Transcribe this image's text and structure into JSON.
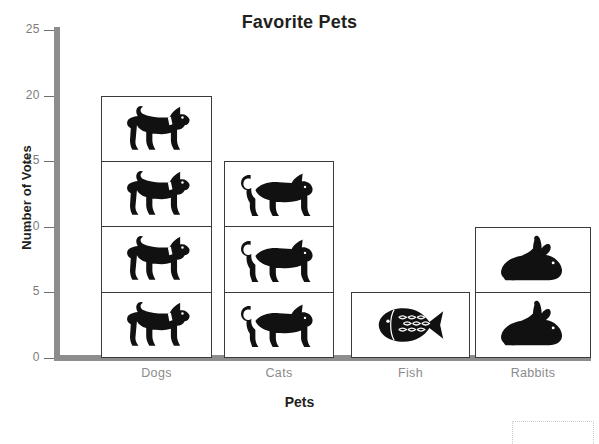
{
  "chart_data": {
    "type": "bar",
    "title": "Favorite Pets",
    "xlabel": "Pets",
    "ylabel": "Number of Votes",
    "categories": [
      "Dogs",
      "Cats",
      "Fish",
      "Rabbits"
    ],
    "values": [
      20,
      15,
      5,
      10
    ],
    "icons": [
      "dog-icon",
      "cat-icon",
      "fish-icon",
      "rabbit-icon"
    ],
    "icon_unit_value": 5,
    "ylim": [
      0,
      25
    ],
    "yticks": [
      0,
      5,
      10,
      15,
      20,
      25
    ],
    "ytick_labels": [
      "0",
      "5",
      "10",
      "15",
      "20",
      "25"
    ],
    "grid": false,
    "legend": "none",
    "bar_fill_color": "#ffffff",
    "bar_border_color": "#3a3a3a",
    "axis_color": "#8d8d8d",
    "tick_label_color": "#7c7c7c",
    "category_label_color": "#8b8b8b",
    "title_color": "#231f20"
  },
  "page": {
    "scan_top_text": "",
    "scan_bottom_text": "",
    "answer_box_label": ""
  }
}
